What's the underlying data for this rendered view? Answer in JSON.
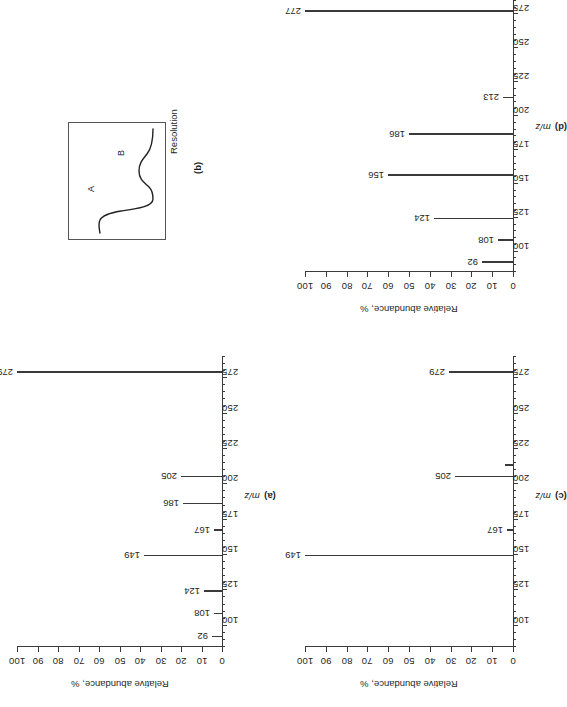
{
  "figure": {
    "orientation": "rotated-90-ccw",
    "panel_count": 4,
    "ink_color": "#3a3a3a",
    "text_color": "#1f1f1f"
  },
  "axes_common": {
    "y_title": "Relative abundance, %",
    "x_title": "m/z",
    "y_ticks": [
      "0",
      "10",
      "20",
      "30",
      "40",
      "50",
      "60",
      "70",
      "80",
      "90",
      "100"
    ],
    "x_ticks": [
      "100",
      "125",
      "150",
      "175",
      "200",
      "225",
      "250",
      "275"
    ],
    "ylim": [
      0,
      100
    ],
    "xlim": [
      85,
      290
    ]
  },
  "panels": {
    "a": {
      "caption": "(a)"
    },
    "b": {
      "caption": "(b)",
      "title": "Resolution",
      "curve_a_label": "A",
      "curve_b_label": "B"
    },
    "c": {
      "caption": "(c)"
    },
    "d": {
      "caption": "(d)"
    }
  },
  "chart_data": [
    {
      "id": "a",
      "type": "bar",
      "title": "(a)",
      "xlabel": "m/z",
      "ylabel": "Relative abundance, %",
      "xlim": [
        85,
        290
      ],
      "ylim": [
        0,
        100
      ],
      "grid": false,
      "legend": "none",
      "x": [
        92,
        108,
        124,
        149,
        167,
        186,
        205,
        279
      ],
      "values": [
        5,
        4,
        9,
        38,
        4,
        19,
        20,
        100
      ],
      "labels": [
        "92",
        "108",
        "124",
        "149",
        "167",
        "186",
        "205",
        "279"
      ],
      "xticks": [
        100,
        125,
        150,
        175,
        200,
        225,
        250,
        275
      ],
      "yticks": [
        0,
        10,
        20,
        30,
        40,
        50,
        60,
        70,
        80,
        90,
        100
      ]
    },
    {
      "id": "b",
      "type": "line",
      "title": "Resolution",
      "xlabel": "",
      "ylabel": "",
      "grid": false,
      "legend": "none",
      "annotations": [
        "A",
        "B"
      ],
      "description": "Two partially resolved chromatographic peaks: a tall narrow peak A followed by a shorter peak B on a flat baseline, drawn inside a rectangular frame."
    },
    {
      "id": "c",
      "type": "bar",
      "title": "(c)",
      "xlabel": "m/z",
      "ylabel": "Relative abundance, %",
      "xlim": [
        85,
        290
      ],
      "ylim": [
        0,
        100
      ],
      "grid": false,
      "legend": "none",
      "x": [
        149,
        167,
        205,
        213,
        279
      ],
      "values": [
        100,
        3,
        28,
        4,
        31
      ],
      "labels": [
        "149",
        "167",
        "205",
        "",
        "279"
      ],
      "xticks": [
        100,
        125,
        150,
        175,
        200,
        225,
        250,
        275
      ],
      "yticks": [
        0,
        10,
        20,
        30,
        40,
        50,
        60,
        70,
        80,
        90,
        100
      ]
    },
    {
      "id": "d",
      "type": "bar",
      "title": "(d)",
      "xlabel": "m/z",
      "ylabel": "Relative abundance, %",
      "xlim": [
        85,
        290
      ],
      "ylim": [
        0,
        100
      ],
      "grid": false,
      "legend": "none",
      "x": [
        92,
        108,
        124,
        156,
        186,
        213,
        277
      ],
      "values": [
        15,
        7,
        38,
        60,
        50,
        5,
        100
      ],
      "labels": [
        "92",
        "108",
        "124",
        "156",
        "186",
        "213",
        "277"
      ],
      "xticks": [
        100,
        125,
        150,
        175,
        200,
        225,
        250,
        275
      ],
      "yticks": [
        0,
        10,
        20,
        30,
        40,
        50,
        60,
        70,
        80,
        90,
        100
      ]
    }
  ]
}
